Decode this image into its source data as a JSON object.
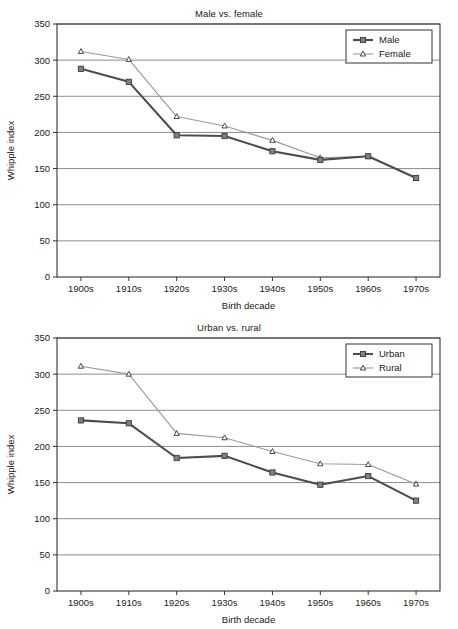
{
  "page": {
    "background_color": "#ffffff"
  },
  "colors": {
    "series_dark": "#4d4d4d",
    "series_dark_marker_fill": "#808080",
    "series_light": "#999999",
    "series_light_marker_fill": "#ffffff",
    "gridline": "#808080",
    "axis": "#333333",
    "text": "#1a1a1a"
  },
  "charts": [
    {
      "id": "male-vs-female",
      "title": "Male vs. female",
      "xlabel": "Birth decade",
      "ylabel": "Whipple index",
      "categories": [
        "1900s",
        "1910s",
        "1920s",
        "1930s",
        "1940s",
        "1950s",
        "1960s",
        "1970s"
      ],
      "yticks": [
        0,
        50,
        100,
        150,
        200,
        250,
        300,
        350
      ],
      "ylim": [
        0,
        350
      ],
      "legend_position": "top-right",
      "series": [
        {
          "name": "Male",
          "marker": "filled-square",
          "values": [
            288,
            270,
            196,
            195,
            174,
            162,
            167,
            137
          ]
        },
        {
          "name": "Female",
          "marker": "open-triangle",
          "values": [
            312,
            301,
            222,
            209,
            189,
            165,
            167,
            137
          ]
        }
      ]
    },
    {
      "id": "urban-vs-rural",
      "title": "Urban vs. rural",
      "xlabel": "Birth decade",
      "ylabel": "Whipple index",
      "categories": [
        "1900s",
        "1910s",
        "1920s",
        "1930s",
        "1940s",
        "1950s",
        "1960s",
        "1970s"
      ],
      "yticks": [
        0,
        50,
        100,
        150,
        200,
        250,
        300,
        350
      ],
      "ylim": [
        0,
        350
      ],
      "legend_position": "top-right",
      "series": [
        {
          "name": "Urban",
          "marker": "filled-square",
          "values": [
            236,
            232,
            184,
            187,
            164,
            147,
            159,
            125
          ]
        },
        {
          "name": "Rural",
          "marker": "open-triangle",
          "values": [
            311,
            300,
            218,
            212,
            193,
            176,
            175,
            148
          ]
        }
      ]
    }
  ],
  "chart_data": [
    {
      "type": "line",
      "title": "Male vs. female",
      "xlabel": "Birth decade",
      "ylabel": "Whipple index",
      "categories": [
        "1900s",
        "1910s",
        "1920s",
        "1930s",
        "1940s",
        "1950s",
        "1960s",
        "1970s"
      ],
      "series": [
        {
          "name": "Male",
          "values": [
            288,
            270,
            196,
            195,
            174,
            162,
            167,
            137
          ]
        },
        {
          "name": "Female",
          "values": [
            312,
            301,
            222,
            209,
            189,
            165,
            167,
            137
          ]
        }
      ],
      "ylim": [
        0,
        350
      ],
      "yticks": [
        0,
        50,
        100,
        150,
        200,
        250,
        300,
        350
      ],
      "grid": "horizontal",
      "legend": "top-right"
    },
    {
      "type": "line",
      "title": "Urban vs. rural",
      "xlabel": "Birth decade",
      "ylabel": "Whipple index",
      "categories": [
        "1900s",
        "1910s",
        "1920s",
        "1930s",
        "1940s",
        "1950s",
        "1960s",
        "1970s"
      ],
      "series": [
        {
          "name": "Urban",
          "values": [
            236,
            232,
            184,
            187,
            164,
            147,
            159,
            125
          ]
        },
        {
          "name": "Rural",
          "values": [
            311,
            300,
            218,
            212,
            193,
            176,
            175,
            148
          ]
        }
      ],
      "ylim": [
        0,
        350
      ],
      "yticks": [
        0,
        50,
        100,
        150,
        200,
        250,
        300,
        350
      ],
      "grid": "horizontal",
      "legend": "top-right"
    }
  ]
}
